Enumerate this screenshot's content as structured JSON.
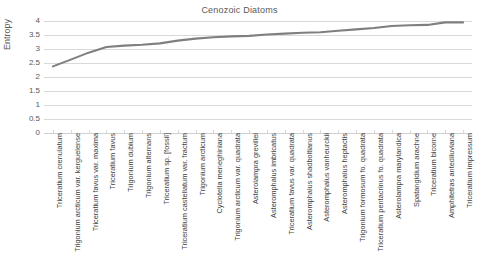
{
  "chart_data": {
    "type": "line",
    "title": "Cenozoic Diatoms",
    "xlabel": "",
    "ylabel": "Entropy",
    "ylim": [
      0,
      4
    ],
    "ytick_labels": [
      "4",
      "3.5",
      "3",
      "2.5",
      "2",
      "1.5",
      "1",
      "0.5",
      "0"
    ],
    "ytick_values": [
      4,
      3.5,
      3,
      2.5,
      2,
      1.5,
      1,
      0.5,
      0
    ],
    "grid": true,
    "legend": "none",
    "line_color": "#7f7f7f",
    "categories": [
      "Triceratium crenulatum",
      "Trigonium arcticum var. kerguelense",
      "Triceratium favus var. maxima",
      "Triceratium favus",
      "Trigonium dubium",
      "Trigonium alternans",
      "Triceratium sp. [fossil]",
      "Triceratium castellatum var. fractum",
      "Trigonium arcticum",
      "Cyclotella meneghiniana",
      "Trigonium arcticum var. quadrata",
      "Asterolampra grevillei",
      "Asteromphalus imbricatus",
      "Triceratium favus var. quadrata",
      "Asteromphalus shadboltianus",
      "Asteromphalus vanheurckii",
      "Asteromphalus heptactis",
      "Trigonium formosum fo. quadrata",
      "Triceratium pentacrinus fo. quadrata",
      "Asterolampra marylandica",
      "Spatangidium arachne",
      "Triceratium bicorne",
      "Amphitetras antediluviana",
      "Triceratium impressum"
    ],
    "values": [
      2.38,
      2.62,
      2.87,
      3.07,
      3.12,
      3.15,
      3.2,
      3.3,
      3.37,
      3.42,
      3.45,
      3.47,
      3.52,
      3.55,
      3.58,
      3.6,
      3.65,
      3.7,
      3.75,
      3.82,
      3.85,
      3.86,
      3.95,
      3.95
    ]
  }
}
